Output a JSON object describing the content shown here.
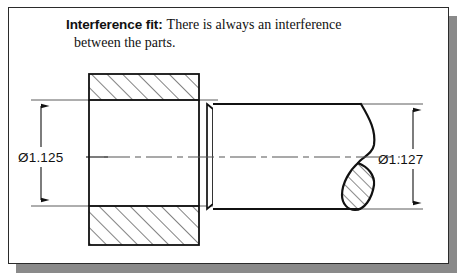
{
  "figure": {
    "type": "engineering-cross-section-drawing",
    "caption": {
      "lead": "Interference fit:",
      "body": "There is always an interference",
      "line2": "between the parts."
    },
    "dimensions": {
      "left": {
        "label": "Ø1.125",
        "meaning": "hole diameter of hatched bushing",
        "arrow_style": "double-headed"
      },
      "right": {
        "label": "Ø1.127",
        "meaning": "shaft outside diameter",
        "arrow_style": "double-headed"
      }
    },
    "parts": [
      {
        "name": "bushing-cross-section",
        "hatching": "45-degree-up-right",
        "description": "sectioned block with central bore"
      },
      {
        "name": "shaft",
        "end": "S-curve break line with hatched teardrop section",
        "description": "solid round shaft inserted into bore"
      }
    ],
    "centerline_style": "dash-dot",
    "colors": {
      "line": "#111111",
      "card": "#ffffff",
      "border": "#2b2b2b",
      "shadow": "#8a8a8a"
    }
  }
}
